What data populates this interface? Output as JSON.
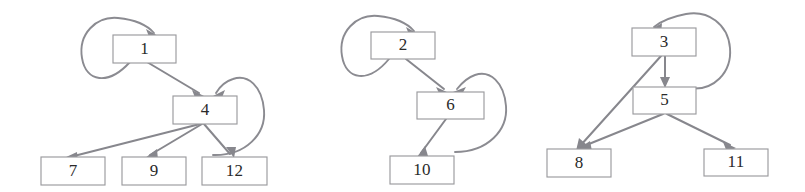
{
  "figure": {
    "background_color": "#ffffff",
    "node_fill": "#ffffff",
    "node_stroke": "#9a9a9e",
    "edge_color": "#87878d",
    "label_color": "#2a2a2a",
    "width": 805,
    "height": 192
  },
  "graphs": [
    {
      "name": "graph-1",
      "nodes": [
        {
          "id": "n1",
          "label": "1",
          "x": 113,
          "y": 35,
          "w": 63,
          "h": 28
        },
        {
          "id": "n4",
          "label": "4",
          "x": 173,
          "y": 96,
          "w": 64,
          "h": 28
        },
        {
          "id": "n7",
          "label": "7",
          "x": 41,
          "y": 157,
          "w": 64,
          "h": 28
        },
        {
          "id": "n9",
          "label": "9",
          "x": 122,
          "y": 157,
          "w": 64,
          "h": 28
        },
        {
          "id": "n12",
          "label": "12",
          "x": 202,
          "y": 157,
          "w": 65,
          "h": 28
        }
      ],
      "edges": [
        {
          "from": "n1",
          "to": "n1",
          "type": "self-loop",
          "side": "left"
        },
        {
          "from": "n1",
          "to": "n4",
          "type": "straight"
        },
        {
          "from": "n4",
          "to": "n4",
          "type": "self-loop",
          "side": "right"
        },
        {
          "from": "n4",
          "to": "n7",
          "type": "straight"
        },
        {
          "from": "n4",
          "to": "n9",
          "type": "straight"
        },
        {
          "from": "n4",
          "to": "n12",
          "type": "straight"
        }
      ]
    },
    {
      "name": "graph-2",
      "nodes": [
        {
          "id": "n2",
          "label": "2",
          "x": 371,
          "y": 32,
          "w": 64,
          "h": 27
        },
        {
          "id": "n6",
          "label": "6",
          "x": 417,
          "y": 92,
          "w": 67,
          "h": 27
        },
        {
          "id": "n10",
          "label": "10",
          "x": 390,
          "y": 156,
          "w": 64,
          "h": 28
        }
      ],
      "edges": [
        {
          "from": "n2",
          "to": "n2",
          "type": "self-loop",
          "side": "left"
        },
        {
          "from": "n2",
          "to": "n6",
          "type": "straight"
        },
        {
          "from": "n6",
          "to": "n6",
          "type": "self-loop",
          "side": "right"
        },
        {
          "from": "n6",
          "to": "n10",
          "type": "straight"
        }
      ]
    },
    {
      "name": "graph-3",
      "nodes": [
        {
          "id": "n3",
          "label": "3",
          "x": 632,
          "y": 28,
          "w": 64,
          "h": 28
        },
        {
          "id": "n5",
          "label": "5",
          "x": 633,
          "y": 87,
          "w": 63,
          "h": 27
        },
        {
          "id": "n8",
          "label": "8",
          "x": 547,
          "y": 149,
          "w": 64,
          "h": 28
        },
        {
          "id": "n11",
          "label": "11",
          "x": 704,
          "y": 149,
          "w": 64,
          "h": 27
        }
      ],
      "edges": [
        {
          "from": "n3",
          "to": "n3",
          "type": "self-loop",
          "side": "right"
        },
        {
          "from": "n3",
          "to": "n5",
          "type": "straight"
        },
        {
          "from": "n3",
          "to": "n8",
          "type": "straight"
        },
        {
          "from": "n5",
          "to": "n8",
          "type": "straight"
        },
        {
          "from": "n5",
          "to": "n11",
          "type": "straight"
        }
      ]
    }
  ],
  "node_labels": {
    "n1": "1",
    "n2": "2",
    "n3": "3",
    "n4": "4",
    "n5": "5",
    "n6": "6",
    "n7": "7",
    "n8": "8",
    "n9": "9",
    "n10": "10",
    "n11": "11",
    "n12": "12"
  }
}
